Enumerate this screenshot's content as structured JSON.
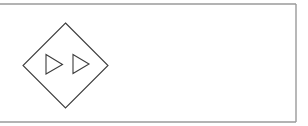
{
  "diagram": {
    "frame": {
      "name": "frame",
      "stroke_color": "#9a9a9a"
    },
    "symbol": {
      "name": "diamond",
      "stroke_color": "#3c3c3c",
      "fill_color": "#ffffff",
      "contents": [
        {
          "name": "play-triangle-left",
          "shape": "triangle",
          "direction": "right"
        },
        {
          "name": "play-triangle-right",
          "shape": "triangle",
          "direction": "right"
        }
      ],
      "icon_semantic": "fast-forward-icon"
    },
    "labels": []
  }
}
